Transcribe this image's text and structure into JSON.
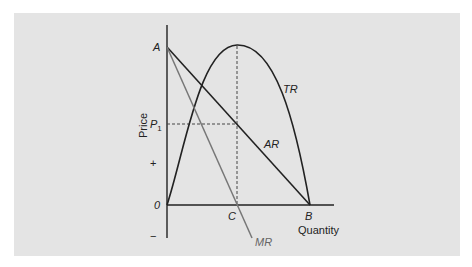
{
  "diagram": {
    "type": "economics-revenue-curves",
    "axes": {
      "y_label": "Price",
      "x_label": "Quantity",
      "y_sign_plus": "+",
      "y_sign_minus": "−",
      "origin_label": "0"
    },
    "points": {
      "A": "A",
      "B": "B",
      "C": "C",
      "P1_main": "P",
      "P1_sub": "1"
    },
    "curves": {
      "TR": "TR",
      "AR": "AR",
      "MR": "MR"
    },
    "colors": {
      "panel_bg": "#e4e4e4",
      "line_dark": "#222222",
      "line_mr": "#777777",
      "dashed": "#444444"
    }
  }
}
